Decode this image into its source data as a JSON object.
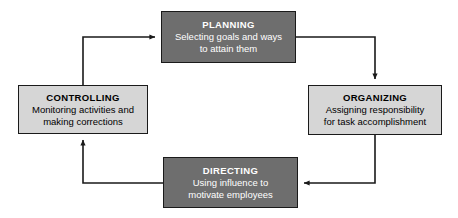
{
  "diagram": {
    "type": "cycle-flowchart",
    "colors": {
      "dark_fill": "#6e6e6e",
      "light_fill": "#d6d6d6",
      "border": "#1a1a1a",
      "dark_text": "#ffffff",
      "light_text": "#000000",
      "arrow": "#1a1a1a",
      "background": "#ffffff"
    },
    "nodes": [
      {
        "id": "planning",
        "title": "PLANNING",
        "desc_line1": "Selecting goals and ways",
        "desc_line2": "to attain them",
        "style": "dark",
        "position": "top"
      },
      {
        "id": "organizing",
        "title": "ORGANIZING",
        "desc_line1": "Assigning responsibility",
        "desc_line2": "for task accomplishment",
        "style": "light",
        "position": "right"
      },
      {
        "id": "directing",
        "title": "DIRECTING",
        "desc_line1": "Using influence to",
        "desc_line2": "motivate employees",
        "style": "dark",
        "position": "bottom"
      },
      {
        "id": "controlling",
        "title": "CONTROLLING",
        "desc_line1": "Monitoring activities and",
        "desc_line2": "making corrections",
        "style": "light",
        "position": "left"
      }
    ],
    "arrows": [
      {
        "id": "controlling-to-planning",
        "from": "controlling",
        "to": "planning"
      },
      {
        "id": "planning-to-organizing",
        "from": "planning",
        "to": "organizing"
      },
      {
        "id": "organizing-to-directing",
        "from": "organizing",
        "to": "directing"
      },
      {
        "id": "directing-to-controlling",
        "from": "directing",
        "to": "controlling"
      }
    ]
  }
}
